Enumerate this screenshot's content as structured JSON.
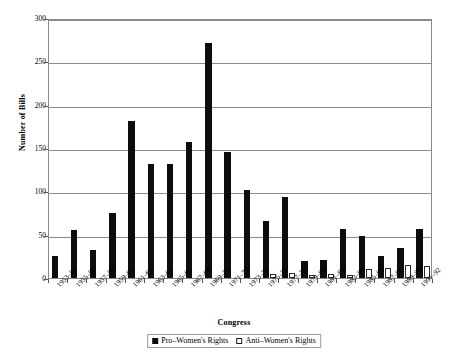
{
  "chart_data": {
    "type": "bar",
    "title": "",
    "xlabel": "Congress",
    "ylabel": "Number of Bills",
    "ylim": [
      0,
      300
    ],
    "ytick_step": 50,
    "yticks": [
      0,
      50,
      100,
      150,
      200,
      250,
      300
    ],
    "grid": "horizontal",
    "legend_position": "bottom-center",
    "categories": [
      "1953–54",
      "1955–56",
      "1957–58",
      "1959–60",
      "1961–62",
      "1963–64",
      "1965–66",
      "1967–68",
      "1969–70",
      "1971–72",
      "1973–74",
      "1975–76",
      "1977–78",
      "1979–80",
      "1981–82",
      "1983–84",
      "1985–86",
      "1987–88",
      "1989–90",
      "1991–92"
    ],
    "series": [
      {
        "name": "Pro–Women's Rights",
        "color": "#0d0d0d",
        "values": [
          25,
          55,
          32,
          75,
          181,
          132,
          132,
          157,
          271,
          145,
          102,
          66,
          93,
          20,
          21,
          57,
          48,
          25,
          35,
          57
        ]
      },
      {
        "name": "Anti–Women's Rights",
        "color": "#ffffff",
        "values": [
          0,
          0,
          0,
          0,
          0,
          0,
          0,
          0,
          0,
          0,
          0,
          5,
          6,
          3,
          5,
          3,
          10,
          12,
          15,
          14
        ]
      }
    ]
  },
  "axes": {
    "y_title": "Number of Bills",
    "x_title": "Congress"
  },
  "legend": {
    "items": [
      {
        "label": "Pro–Women's Rights",
        "swatch": "filled-black-square"
      },
      {
        "label": "Anti–Women's Rights",
        "swatch": "open-white-square"
      }
    ]
  },
  "title_fragment": ""
}
